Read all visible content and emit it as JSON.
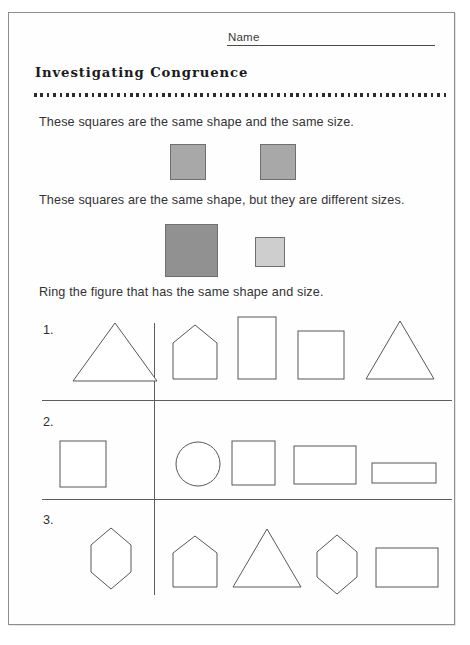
{
  "worksheet": {
    "name_label": "Name",
    "title": "Investigating Congruence",
    "statements": [
      "These squares are the same shape and the same size.",
      "These squares are the same shape, but they are different sizes.",
      "Ring the figure that has the same shape and size."
    ],
    "demo_squares": {
      "pair_same": [
        {
          "label": "gray-square-left",
          "color": "#a8a8a8",
          "size": "same"
        },
        {
          "label": "gray-square-right",
          "color": "#a8a8a8",
          "size": "same"
        }
      ],
      "pair_different": [
        {
          "label": "large-dark-square",
          "color": "#919191",
          "size": "large"
        },
        {
          "label": "small-light-square",
          "color": "#cecece",
          "size": "small"
        }
      ]
    },
    "problems": [
      {
        "number": "1.",
        "reference": "triangle",
        "choices": [
          "pentagon-house",
          "tall-rectangle",
          "square",
          "triangle"
        ]
      },
      {
        "number": "2.",
        "reference": "square",
        "choices": [
          "circle",
          "square",
          "wide-rectangle",
          "flat-rectangle"
        ]
      },
      {
        "number": "3.",
        "reference": "hexagon",
        "choices": [
          "pentagon-house",
          "triangle",
          "hexagon",
          "rectangle"
        ]
      }
    ]
  }
}
